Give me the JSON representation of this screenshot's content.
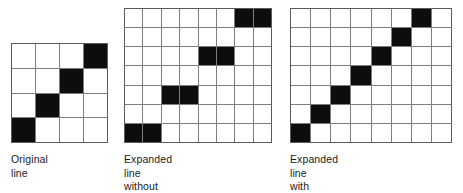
{
  "figure": {
    "name": "interpolative-scaling-comparison",
    "background_color": "#ffffff",
    "cell_on_color": "#0d0d0d",
    "cell_off_color": "#ffffff",
    "grid_line_color": "#7d7d7d",
    "grid_border_color": "#5b5b5b"
  },
  "panels": [
    {
      "id": "original",
      "caption": "Original line",
      "grid": {
        "columns": 4,
        "rows": 4,
        "filled_cells": [
          [
            0,
            3
          ],
          [
            1,
            2
          ],
          [
            2,
            1
          ],
          [
            3,
            0
          ]
        ]
      }
    },
    {
      "id": "expanded_plain",
      "caption": "Expanded line\nwithout interpolative scaling",
      "grid": {
        "columns": 8,
        "rows": 7,
        "filled_cells": [
          [
            0,
            6
          ],
          [
            0,
            7
          ],
          [
            2,
            4
          ],
          [
            2,
            5
          ],
          [
            4,
            2
          ],
          [
            4,
            3
          ],
          [
            6,
            0
          ],
          [
            6,
            1
          ]
        ]
      }
    },
    {
      "id": "expanded_interp",
      "caption": "Expanded line\nwith interpolative scaling",
      "grid": {
        "columns": 8,
        "rows": 7,
        "filled_cells": [
          [
            0,
            6
          ],
          [
            1,
            5
          ],
          [
            2,
            4
          ],
          [
            3,
            3
          ],
          [
            4,
            2
          ],
          [
            5,
            1
          ],
          [
            6,
            0
          ]
        ]
      }
    }
  ],
  "captions": {
    "original": "Original line",
    "expanded_plain": "Expanded line\nwithout interpolative scaling",
    "expanded_interp": "Expanded line\nwith interpolative scaling"
  }
}
